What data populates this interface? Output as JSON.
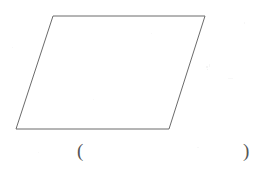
{
  "canvas": {
    "width": 263,
    "height": 180,
    "background_color": "#ffffff"
  },
  "figure": {
    "name": "parallelogram",
    "shape_type": "parallelogram",
    "stroke_color": "#6b6b6b",
    "stroke_width": 1,
    "fill": "none",
    "vertices": [
      {
        "label": "top-left",
        "x": 53,
        "y": 16
      },
      {
        "label": "top-right",
        "x": 205,
        "y": 16
      },
      {
        "label": "bottom-right",
        "x": 169,
        "y": 129
      },
      {
        "label": "bottom-left",
        "x": 16,
        "y": 129
      }
    ],
    "points_attr": "53,16 205,16 169,129 16,129"
  },
  "answer": {
    "open_paren": "(",
    "close_paren": ")",
    "blank_color": "#555555"
  }
}
